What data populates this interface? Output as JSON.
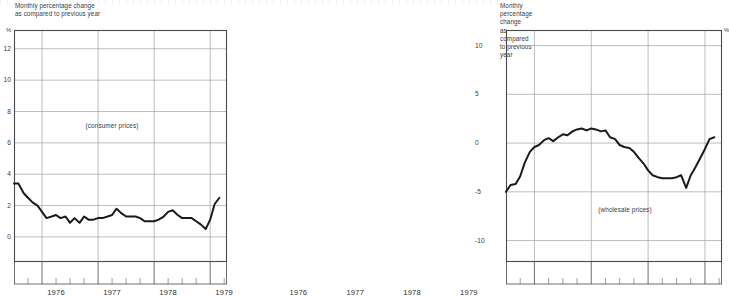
{
  "page": {
    "background_color": "#ffffff",
    "line_color": "#1a1a1a",
    "grid_color": "#9a9a9a",
    "axis_color": "#4a4a4a"
  },
  "panels": [
    {
      "id": "consumer",
      "caption": "Monthly percentage change\nas compared to previous year",
      "percent_symbol": "%",
      "series_note": "(consumer prices)",
      "axis_side": "left"
    },
    {
      "id": "wholesale",
      "caption": "Monthly percentage change\nas compared to previous year",
      "percent_symbol": "%",
      "series_note": "(wholesale prices)",
      "axis_side": "right"
    }
  ],
  "chart_data": [
    {
      "type": "line",
      "title": "Monthly percentage change as compared to previous year",
      "subtitle": "(consumer prices)",
      "xlabel": "",
      "ylabel": "%",
      "grid": true,
      "legend": "none",
      "axis_side": "left",
      "xlim": [
        1975.5,
        1979.3
      ],
      "ylim": [
        -1.6,
        13.2
      ],
      "yticks": [
        0,
        2,
        4,
        6,
        8,
        10,
        12
      ],
      "ytick_labels": [
        "0",
        "2",
        "4",
        "6",
        "8",
        "10",
        "12"
      ],
      "xticks": [
        1976,
        1977,
        1978,
        1979
      ],
      "xtick_labels": [
        "1976",
        "1977",
        "1978",
        "1979"
      ],
      "xminor_ticks": [
        1975.75,
        1976.25,
        1976.5,
        1976.75,
        1977.25,
        1977.5,
        1977.75,
        1978.25,
        1978.5,
        1978.75,
        1979.25
      ],
      "x": [
        1975.5,
        1975.58,
        1975.67,
        1975.75,
        1975.83,
        1975.92,
        1976.0,
        1976.08,
        1976.17,
        1976.25,
        1976.33,
        1976.42,
        1976.5,
        1976.58,
        1976.67,
        1976.75,
        1976.83,
        1976.92,
        1977.0,
        1977.08,
        1977.17,
        1977.25,
        1977.33,
        1977.42,
        1977.5,
        1977.58,
        1977.67,
        1977.75,
        1977.83,
        1977.92,
        1978.0,
        1978.08,
        1978.17,
        1978.25,
        1978.33,
        1978.42,
        1978.5,
        1978.58,
        1978.67,
        1978.75,
        1978.83,
        1978.92,
        1979.0,
        1979.08
      ],
      "values": [
        3.4,
        3.4,
        2.8,
        2.5,
        2.2,
        2.0,
        1.6,
        1.2,
        1.3,
        1.4,
        1.2,
        1.3,
        0.9,
        1.2,
        0.9,
        1.3,
        1.1,
        1.1,
        1.2,
        1.2,
        1.3,
        1.4,
        1.8,
        1.5,
        1.3,
        1.3,
        1.3,
        1.2,
        1.0,
        1.0,
        1.0,
        1.1,
        1.3,
        1.6,
        1.7,
        1.4,
        1.2,
        1.2,
        1.2,
        1.0,
        0.8,
        0.5,
        1.1,
        2.1
      ],
      "final_value": 2.5,
      "series_color": "#1a1a1a"
    },
    {
      "type": "line",
      "title": "Monthly percentage change as compared to previous year",
      "subtitle": "(wholesale prices)",
      "xlabel": "",
      "ylabel": "%",
      "grid": true,
      "legend": "none",
      "axis_side": "right",
      "xlim": [
        1975.5,
        1979.3
      ],
      "ylim": [
        -12.2,
        11.6
      ],
      "yticks": [
        -10,
        -5,
        0,
        5,
        10
      ],
      "ytick_labels": [
        "-10",
        "-5",
        "0",
        "5",
        "10"
      ],
      "xticks": [
        1976,
        1977,
        1978,
        1979
      ],
      "xtick_labels": [
        "1976",
        "1977",
        "1978",
        "1979"
      ],
      "xminor_ticks": [
        1975.75,
        1976.25,
        1976.5,
        1976.75,
        1977.25,
        1977.5,
        1977.75,
        1978.25,
        1978.5,
        1978.75,
        1979.25
      ],
      "x": [
        1975.5,
        1975.58,
        1975.67,
        1975.75,
        1975.83,
        1975.92,
        1976.0,
        1976.08,
        1976.17,
        1976.25,
        1976.33,
        1976.42,
        1976.5,
        1976.58,
        1976.67,
        1976.75,
        1976.83,
        1976.92,
        1977.0,
        1977.08,
        1977.17,
        1977.25,
        1977.33,
        1977.42,
        1977.5,
        1977.58,
        1977.67,
        1977.75,
        1977.83,
        1977.92,
        1978.0,
        1978.08,
        1978.17,
        1978.25,
        1978.33,
        1978.42,
        1978.5,
        1978.58,
        1978.67,
        1978.75,
        1978.83,
        1978.92,
        1979.0,
        1979.08
      ],
      "values": [
        -5.0,
        -4.3,
        -4.2,
        -3.4,
        -2.0,
        -0.9,
        -0.4,
        -0.2,
        0.3,
        0.5,
        0.2,
        0.6,
        0.9,
        0.8,
        1.2,
        1.4,
        1.5,
        1.3,
        1.5,
        1.4,
        1.2,
        1.3,
        0.6,
        0.4,
        -0.2,
        -0.4,
        -0.5,
        -0.9,
        -1.5,
        -2.1,
        -2.8,
        -3.3,
        -3.5,
        -3.6,
        -3.6,
        -3.6,
        -3.5,
        -3.3,
        -4.6,
        -3.3,
        -2.5,
        -1.5,
        -0.6,
        0.4
      ],
      "final_value": 0.6,
      "series_color": "#1a1a1a"
    }
  ]
}
